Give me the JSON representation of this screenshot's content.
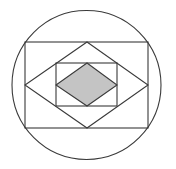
{
  "diagram": {
    "colors": {
      "stroke": "#3a3a3a",
      "shaded_fill": "#c4c4c4",
      "background": "#ffffff"
    },
    "shapes": {
      "circle": {
        "cx": 86.5,
        "cy": 85,
        "r": 74.5
      },
      "outer_rectangle": {
        "x": 25,
        "y": 42,
        "width": 123,
        "height": 86
      },
      "middle_rhombus": {
        "points": "87,42 148,85 87,128 25,85"
      },
      "inner_rectangle": {
        "x": 56,
        "y": 63,
        "width": 61,
        "height": 43
      },
      "shaded_rhombus": {
        "points": "87,63 117,85 87,106 56,85"
      }
    }
  }
}
